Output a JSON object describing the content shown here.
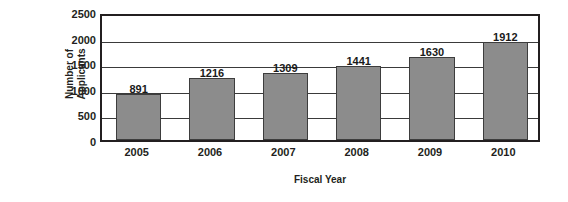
{
  "chart_data": {
    "type": "bar",
    "title": "",
    "xlabel": "Fiscal Year",
    "ylabel": "Number of Applicants",
    "ylabel_line1": "Number of",
    "ylabel_line2": "Applicants",
    "categories": [
      "2005",
      "2006",
      "2007",
      "2008",
      "2009",
      "2010"
    ],
    "values": [
      891,
      1216,
      1309,
      1441,
      1630,
      1912
    ],
    "value_labels": [
      "891",
      "1216",
      "1309",
      "1441",
      "1630",
      "1912"
    ],
    "ylim": [
      0,
      2500
    ],
    "ytick_labels": [
      "2500",
      "2000",
      "1500",
      "1000",
      "500",
      "0"
    ],
    "ytick_values": [
      2500,
      2000,
      1500,
      1000,
      500,
      0
    ],
    "grid": true,
    "grid_axis": "y",
    "legend": "none",
    "bar_color": "#8c8c8c",
    "bar_edge_color": "#3d3d3d",
    "axis_color": "#231f20",
    "background_color": "#ffffff"
  }
}
